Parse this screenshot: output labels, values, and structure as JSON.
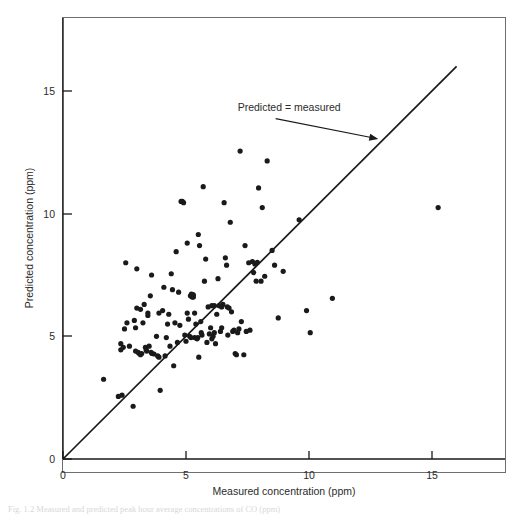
{
  "figure": {
    "caption": "Fig. 1.2   Measured and predicted peak hour average concentrations of CO (ppm)"
  },
  "chart_data": {
    "type": "scatter",
    "title": "",
    "xlabel": "Measured concentration (ppm)",
    "ylabel": "Predicted concentration (ppm)",
    "xlim": [
      0,
      17.8
    ],
    "ylim": [
      0,
      18.2
    ],
    "xticks": [
      0,
      5,
      10,
      15
    ],
    "yticks": [
      0,
      5,
      10,
      15
    ],
    "xtick_labels": [
      "0",
      "5",
      "10",
      "15"
    ],
    "ytick_labels": [
      "0",
      "5",
      "10",
      "15"
    ],
    "grid": false,
    "legend": "none",
    "annotations": [
      {
        "text": "Predicted = measured",
        "text_x": 7.1,
        "text_y": 14.2,
        "arrow_to_x": 12.9,
        "arrow_to_y": 12.9
      }
    ],
    "reference_line": {
      "label": "Predicted = measured",
      "slope": 1,
      "intercept": 0,
      "x_start": 0,
      "y_start": 0,
      "x_end": 16.0,
      "y_end": 16.0
    },
    "marker": "circle",
    "marker_color": "#1a1a1a",
    "marker_size": 3,
    "n_points": 140,
    "points": [
      [
        1.65,
        3.25
      ],
      [
        2.25,
        2.55
      ],
      [
        2.35,
        4.7
      ],
      [
        2.35,
        4.45
      ],
      [
        2.45,
        4.55
      ],
      [
        2.5,
        5.3
      ],
      [
        2.55,
        8.0
      ],
      [
        2.6,
        5.55
      ],
      [
        2.85,
        2.15
      ],
      [
        2.9,
        5.65
      ],
      [
        2.95,
        5.35
      ],
      [
        3.0,
        6.15
      ],
      [
        3.0,
        7.75
      ],
      [
        3.05,
        4.35
      ],
      [
        3.1,
        4.3
      ],
      [
        3.15,
        4.25
      ],
      [
        3.25,
        5.55
      ],
      [
        3.3,
        6.3
      ],
      [
        3.35,
        4.55
      ],
      [
        3.38,
        4.45
      ],
      [
        3.4,
        4.4
      ],
      [
        3.45,
        5.95
      ],
      [
        3.45,
        5.85
      ],
      [
        3.5,
        4.6
      ],
      [
        3.55,
        6.65
      ],
      [
        3.6,
        7.5
      ],
      [
        3.62,
        4.3
      ],
      [
        3.7,
        4.28
      ],
      [
        3.8,
        5.0
      ],
      [
        3.85,
        4.2
      ],
      [
        3.9,
        4.15
      ],
      [
        3.95,
        2.8
      ],
      [
        4.05,
        6.05
      ],
      [
        4.1,
        7.0
      ],
      [
        4.15,
        4.2
      ],
      [
        4.3,
        5.9
      ],
      [
        4.35,
        4.6
      ],
      [
        4.4,
        7.55
      ],
      [
        4.5,
        3.8
      ],
      [
        4.55,
        5.55
      ],
      [
        4.6,
        8.45
      ],
      [
        4.65,
        4.75
      ],
      [
        4.7,
        6.8
      ],
      [
        4.8,
        10.5
      ],
      [
        4.85,
        10.5
      ],
      [
        4.9,
        10.45
      ],
      [
        5.0,
        4.8
      ],
      [
        5.05,
        8.8
      ],
      [
        5.1,
        5.7
      ],
      [
        5.15,
        5.0
      ],
      [
        5.2,
        4.95
      ],
      [
        5.25,
        6.6
      ],
      [
        5.28,
        6.7
      ],
      [
        5.3,
        6.6
      ],
      [
        5.35,
        4.95
      ],
      [
        5.4,
        5.5
      ],
      [
        5.45,
        4.9
      ],
      [
        5.5,
        9.15
      ],
      [
        5.52,
        4.15
      ],
      [
        5.55,
        8.7
      ],
      [
        5.6,
        5.6
      ],
      [
        5.65,
        5.05
      ],
      [
        5.7,
        11.1
      ],
      [
        5.75,
        7.25
      ],
      [
        5.8,
        8.15
      ],
      [
        5.85,
        4.75
      ],
      [
        5.9,
        6.2
      ],
      [
        6.0,
        5.35
      ],
      [
        6.05,
        4.9
      ],
      [
        6.1,
        5.0
      ],
      [
        6.15,
        6.25
      ],
      [
        6.2,
        4.7
      ],
      [
        6.3,
        7.35
      ],
      [
        6.35,
        6.25
      ],
      [
        6.4,
        5.2
      ],
      [
        6.45,
        5.35
      ],
      [
        6.5,
        6.3
      ],
      [
        6.55,
        10.45
      ],
      [
        6.6,
        8.2
      ],
      [
        6.65,
        7.9
      ],
      [
        6.7,
        5.05
      ],
      [
        6.75,
        6.15
      ],
      [
        6.8,
        9.65
      ],
      [
        6.85,
        6.0
      ],
      [
        6.9,
        5.2
      ],
      [
        6.95,
        5.25
      ],
      [
        7.0,
        4.3
      ],
      [
        7.05,
        4.25
      ],
      [
        7.1,
        5.15
      ],
      [
        7.2,
        12.55
      ],
      [
        7.25,
        5.6
      ],
      [
        7.4,
        8.7
      ],
      [
        7.45,
        5.2
      ],
      [
        7.55,
        8.0
      ],
      [
        7.7,
        8.05
      ],
      [
        7.75,
        7.6
      ],
      [
        7.8,
        7.95
      ],
      [
        7.85,
        7.25
      ],
      [
        7.95,
        11.05
      ],
      [
        8.05,
        7.25
      ],
      [
        8.1,
        10.25
      ],
      [
        8.2,
        7.45
      ],
      [
        8.3,
        12.15
      ],
      [
        8.5,
        8.5
      ],
      [
        8.6,
        7.9
      ],
      [
        8.75,
        5.75
      ],
      [
        8.95,
        7.65
      ],
      [
        9.6,
        9.75
      ],
      [
        9.9,
        6.05
      ],
      [
        10.05,
        5.15
      ],
      [
        10.95,
        6.55
      ],
      [
        15.25,
        10.25
      ],
      [
        2.7,
        4.6
      ],
      [
        3.2,
        4.3
      ],
      [
        3.58,
        4.35
      ],
      [
        4.25,
        5.5
      ],
      [
        4.95,
        5.05
      ],
      [
        5.18,
        6.65
      ],
      [
        5.62,
        5.15
      ],
      [
        6.25,
        5.9
      ],
      [
        6.68,
        6.2
      ],
      [
        7.35,
        4.25
      ],
      [
        3.9,
        5.95
      ],
      [
        4.45,
        6.9
      ],
      [
        5.05,
        5.95
      ],
      [
        5.95,
        5.1
      ],
      [
        6.45,
        6.2
      ],
      [
        2.95,
        4.4
      ],
      [
        4.2,
        4.95
      ],
      [
        5.48,
        4.95
      ],
      [
        6.05,
        6.25
      ],
      [
        7.15,
        5.3
      ],
      [
        3.15,
        6.1
      ],
      [
        4.75,
        5.45
      ],
      [
        5.35,
        5.95
      ],
      [
        6.15,
        5.15
      ],
      [
        7.6,
        5.25
      ],
      [
        5.22,
        6.72
      ],
      [
        5.3,
        6.68
      ],
      [
        7.9,
        8.02
      ],
      [
        2.4,
        2.6
      ]
    ]
  },
  "axes": {
    "x_title": "Measured concentration (ppm)",
    "y_title": "Predicted concentration (ppm)"
  }
}
